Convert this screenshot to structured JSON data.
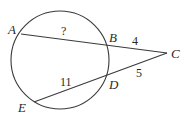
{
  "diagram": {
    "type": "circle-secants",
    "circle": {
      "cx": 60,
      "cy": 60,
      "r": 49
    },
    "points": {
      "A": {
        "label": "A",
        "x": 21,
        "y": 34,
        "label_x": 8,
        "label_y": 34
      },
      "B": {
        "label": "B",
        "x": 107,
        "y": 45,
        "label_x": 109,
        "label_y": 42
      },
      "C": {
        "label": "C",
        "x": 167,
        "y": 53,
        "label_x": 171,
        "label_y": 58
      },
      "D": {
        "label": "D",
        "x": 106,
        "y": 76,
        "label_x": 109,
        "label_y": 89
      },
      "E": {
        "label": "E",
        "x": 34,
        "y": 102,
        "label_x": 18,
        "label_y": 112
      }
    },
    "segments": [
      {
        "from": "A",
        "to": "C"
      },
      {
        "from": "E",
        "to": "C"
      }
    ],
    "measures": {
      "AB": {
        "text": "?",
        "x": 61,
        "y": 35
      },
      "BC": {
        "text": "4",
        "x": 132,
        "y": 45
      },
      "DC": {
        "text": "5",
        "x": 136,
        "y": 77
      },
      "ED": {
        "text": "11",
        "x": 60,
        "y": 86
      }
    }
  }
}
